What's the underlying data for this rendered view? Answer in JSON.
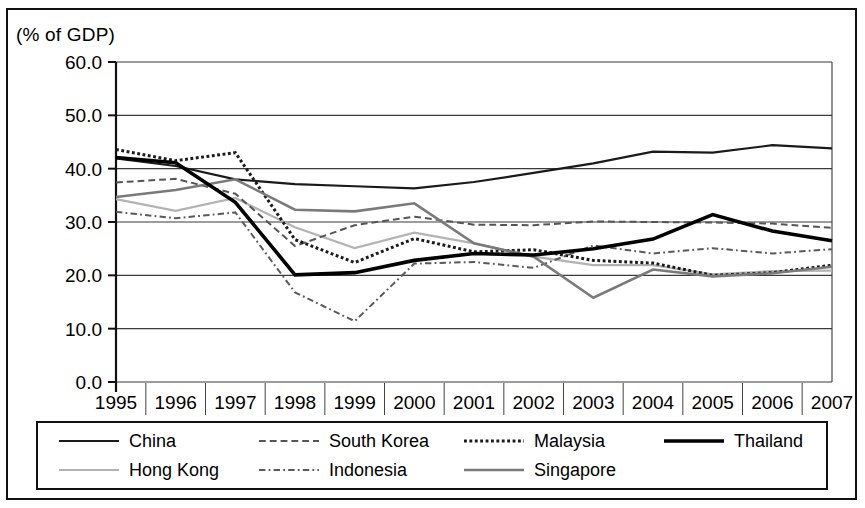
{
  "figure": {
    "y_axis_unit_label": "(% of GDP)"
  },
  "legend": {
    "entries": [
      {
        "label": "China",
        "style": "solid",
        "color": "#1a1a1a",
        "width": 2.2
      },
      {
        "label": "South Korea",
        "style": "dashed",
        "color": "#555555",
        "width": 2.0
      },
      {
        "label": "Malaysia",
        "style": "dotted",
        "color": "#1a1a1a",
        "width": 3.0
      },
      {
        "label": "Thailand",
        "style": "solid",
        "color": "#000000",
        "width": 3.6
      },
      {
        "label": "Hong Kong",
        "style": "solid",
        "color": "#b3b3b3",
        "width": 2.2
      },
      {
        "label": "Indonesia",
        "style": "dashdot",
        "color": "#5a5a5a",
        "width": 2.0
      },
      {
        "label": "Singapore",
        "style": "solid",
        "color": "#7a7a7a",
        "width": 2.6
      }
    ]
  },
  "chart_data": {
    "type": "line",
    "title": "",
    "subtitle": "",
    "xlabel": "",
    "ylabel": "(% of GDP)",
    "categories": [
      "1995",
      "1996",
      "1997",
      "1998",
      "1999",
      "2000",
      "2001",
      "2002",
      "2003",
      "2004",
      "2005",
      "2006",
      "2007"
    ],
    "x": [
      1995,
      1996,
      1997,
      1998,
      1999,
      2000,
      2001,
      2002,
      2003,
      2004,
      2005,
      2006,
      2007
    ],
    "ylim": [
      0.0,
      60.0
    ],
    "ytick_labels": [
      "0.0",
      "10.0",
      "20.0",
      "30.0",
      "40.0",
      "50.0",
      "60.0"
    ],
    "ytick_values": [
      0.0,
      10.0,
      20.0,
      30.0,
      40.0,
      50.0,
      60.0
    ],
    "grid": true,
    "grid_axis": "y",
    "legend_position": "bottom",
    "series": [
      {
        "name": "China",
        "style": "solid",
        "color": "#1a1a1a",
        "width": 2.2,
        "values": [
          41.9,
          40.5,
          38.0,
          37.1,
          36.7,
          36.3,
          37.5,
          39.2,
          41.0,
          43.2,
          43.0,
          44.4,
          43.8
        ]
      },
      {
        "name": "Hong Kong",
        "style": "solid",
        "color": "#b3b3b3",
        "width": 2.2,
        "values": [
          34.3,
          32.1,
          34.5,
          29.0,
          25.1,
          28.0,
          26.0,
          23.5,
          21.9,
          21.9,
          20.2,
          20.8,
          20.9
        ]
      },
      {
        "name": "South Korea",
        "style": "dashed",
        "color": "#555555",
        "width": 2.0,
        "values": [
          37.4,
          38.1,
          35.3,
          25.5,
          29.4,
          31.0,
          29.5,
          29.4,
          30.1,
          30.0,
          29.9,
          29.7,
          28.9
        ]
      },
      {
        "name": "Indonesia",
        "style": "dashdot",
        "color": "#5a5a5a",
        "width": 2.0,
        "values": [
          31.9,
          30.7,
          31.8,
          16.8,
          11.4,
          22.2,
          22.5,
          21.4,
          25.6,
          24.1,
          25.1,
          24.1,
          24.9
        ]
      },
      {
        "name": "Malaysia",
        "style": "dotted",
        "color": "#1a1a1a",
        "width": 3.0,
        "values": [
          43.6,
          41.5,
          43.0,
          26.7,
          22.4,
          26.9,
          24.4,
          24.8,
          22.8,
          22.3,
          20.0,
          20.5,
          21.9
        ]
      },
      {
        "name": "Singapore",
        "style": "solid",
        "color": "#7a7a7a",
        "width": 2.6,
        "values": [
          34.7,
          36.0,
          38.0,
          32.3,
          32.0,
          33.5,
          26.0,
          23.5,
          15.8,
          21.1,
          19.8,
          20.4,
          21.6
        ]
      },
      {
        "name": "Thailand",
        "style": "solid",
        "color": "#000000",
        "width": 3.6,
        "values": [
          42.1,
          41.1,
          33.7,
          20.1,
          20.5,
          22.8,
          24.1,
          23.8,
          25.0,
          26.8,
          31.4,
          28.3,
          26.5
        ]
      }
    ]
  }
}
